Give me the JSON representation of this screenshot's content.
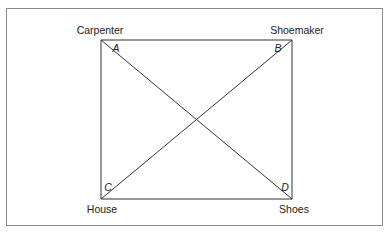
{
  "diagram": {
    "type": "exchange-square-with-diagonals",
    "frame_color": "#8a8a8a",
    "line_color": "#333333",
    "nodes": [
      {
        "id": "A",
        "corner_letter": "A",
        "label": "Carpenter",
        "position": "top-left"
      },
      {
        "id": "B",
        "corner_letter": "B",
        "label": "Shoemaker",
        "position": "top-right"
      },
      {
        "id": "C",
        "corner_letter": "C",
        "label": "House",
        "position": "bottom-left"
      },
      {
        "id": "D",
        "corner_letter": "D",
        "label": "Shoes",
        "position": "bottom-right"
      }
    ],
    "edges": [
      {
        "from": "A",
        "to": "B"
      },
      {
        "from": "B",
        "to": "D"
      },
      {
        "from": "D",
        "to": "C"
      },
      {
        "from": "C",
        "to": "A"
      },
      {
        "from": "A",
        "to": "D"
      },
      {
        "from": "B",
        "to": "C"
      }
    ]
  }
}
